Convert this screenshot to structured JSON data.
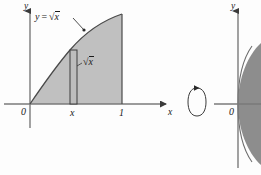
{
  "figure": {
    "kind": "calculus-solid-of-revolution-figure",
    "background_color": "#fdfdfd",
    "axis_color": "#6e6e6e",
    "curve_color": "#4a4a4a",
    "region_fill": "#b8b8b8",
    "solid_fill": "#8a8a8a",
    "text_color": "#1a1a1a"
  },
  "left_panel": {
    "name": "region-under-curve",
    "y_axis_label": "y",
    "x_axis_label": "x",
    "origin_label": "0",
    "curve_equation_label": {
      "lhs": "y",
      "equals": "=",
      "radical": "√",
      "radicand": "x"
    },
    "strip_height_label": {
      "radical": "√",
      "radicand": "x"
    },
    "x_tick_labels": [
      "x",
      "1"
    ],
    "shaded_region_description": "region between y = √x and the x-axis from x = 0 to x = 1",
    "strip_description": "thin vertical rectangle at x of height √x"
  },
  "rotation_arrow": {
    "name": "rotation-arrow",
    "description": "circular arrow indicating revolution about the x-axis"
  },
  "right_panel": {
    "name": "solid-of-revolution",
    "y_axis_label": "y",
    "origin_label": "0",
    "solid_description": "solid generated by revolving the region about the x-axis"
  }
}
